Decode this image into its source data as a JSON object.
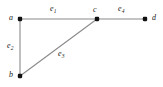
{
  "figure": {
    "type": "undirected-graph-diagram",
    "background_color": "#ffffff",
    "edge_color": "#8a8a8a",
    "vertex_color": "#111111",
    "label_color": "#1a1a1a",
    "width": 163,
    "height": 87
  },
  "vertices": [
    {
      "id": "a",
      "label": "a",
      "x": 20,
      "y": 19,
      "label_x": 9,
      "label_y": 14
    },
    {
      "id": "b",
      "label": "b",
      "x": 20,
      "y": 76,
      "label_x": 9,
      "label_y": 71
    },
    {
      "id": "c",
      "label": "c",
      "x": 97,
      "y": 19,
      "label_x": 93,
      "label_y": 6
    },
    {
      "id": "d",
      "label": "d",
      "x": 145,
      "y": 19,
      "label_x": 152,
      "label_y": 14
    }
  ],
  "edges": [
    {
      "id": "e1",
      "label_base": "e",
      "label_sub": "1",
      "from": "a",
      "to": "c",
      "label_x": 50,
      "label_y": 5
    },
    {
      "id": "e2",
      "label_base": "e",
      "label_sub": "2",
      "from": "a",
      "to": "b",
      "label_x": 7,
      "label_y": 42
    },
    {
      "id": "e3",
      "label_base": "e",
      "label_sub": "3",
      "from": "b",
      "to": "c",
      "label_x": 58,
      "label_y": 50
    },
    {
      "id": "e4",
      "label_base": "e",
      "label_sub": "4",
      "from": "c",
      "to": "d",
      "label_x": 118,
      "label_y": 5
    }
  ]
}
